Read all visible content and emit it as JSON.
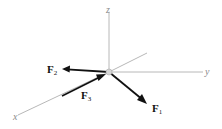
{
  "diagram": {
    "type": "3d-force-vector-diagram",
    "origin": {
      "x": 109,
      "y": 72
    },
    "axes": [
      {
        "name": "z",
        "label": "z",
        "end": {
          "x": 109,
          "y": 12
        },
        "label_pos": {
          "x": 106,
          "y": 13
        }
      },
      {
        "name": "y",
        "label": "y",
        "end": {
          "x": 203,
          "y": 72
        },
        "label_pos": {
          "x": 205,
          "y": 75
        }
      },
      {
        "name": "x",
        "label": "x",
        "end": {
          "x": 18,
          "y": 115
        },
        "label_pos": {
          "x": 13,
          "y": 120
        }
      },
      {
        "name": "neg-x",
        "label": "",
        "end": {
          "x": 147,
          "y": 53
        }
      }
    ],
    "forces": [
      {
        "name": "F1",
        "symbol": "F",
        "subscript": "1",
        "direction": "down-right",
        "tail": {
          "x": 109,
          "y": 72
        },
        "tip": {
          "x": 146,
          "y": 103
        },
        "label_pos": {
          "x": 152,
          "y": 112
        }
      },
      {
        "name": "F2",
        "symbol": "F",
        "subscript": "2",
        "direction": "left",
        "tail": {
          "x": 109,
          "y": 72
        },
        "tip": {
          "x": 63,
          "y": 69
        },
        "label_pos": {
          "x": 47,
          "y": 73
        }
      },
      {
        "name": "F3",
        "symbol": "F",
        "subscript": "3",
        "direction": "toward-origin-along-x",
        "tail": {
          "x": 62,
          "y": 96
        },
        "tip": {
          "x": 106,
          "y": 74
        },
        "label_pos": {
          "x": 81,
          "y": 99
        }
      }
    ],
    "colors": {
      "axis": "#b8b8b8",
      "force": "#111111",
      "origin_node": "#d6d6d6",
      "background": "#ffffff"
    }
  }
}
